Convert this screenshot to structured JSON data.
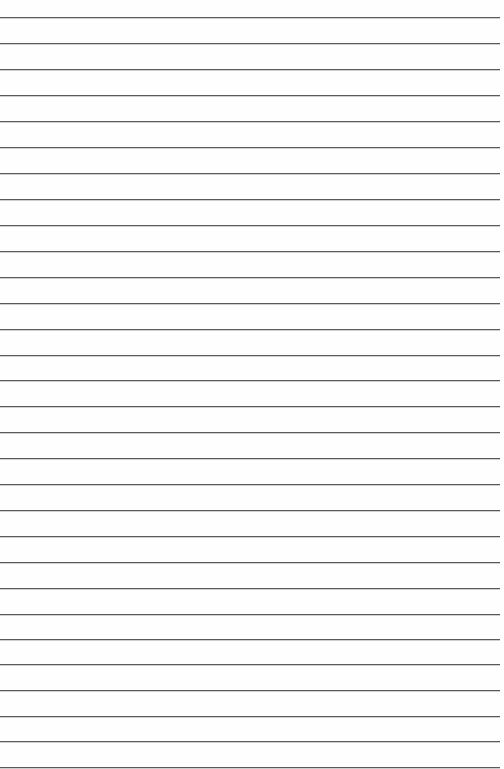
{
  "page": {
    "type": "lined-paper",
    "background_color": "#fefefe",
    "rule_color": "#5a5a5a",
    "rule_count": 30,
    "rule_positions_y": [
      17,
      43,
      69,
      95,
      121,
      147,
      173,
      199,
      225,
      251,
      277,
      303,
      329,
      355,
      380,
      406,
      432,
      458,
      484,
      510,
      536,
      562,
      588,
      614,
      639,
      664,
      690,
      716,
      741,
      767
    ]
  }
}
